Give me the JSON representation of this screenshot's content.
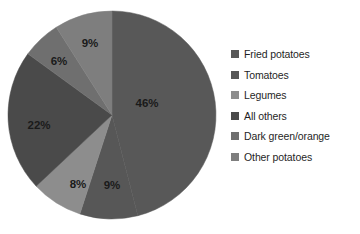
{
  "chart_data": {
    "type": "pie",
    "title": "",
    "subtitle": "",
    "xlabel": "",
    "ylabel": "",
    "grid": false,
    "legend_position": "right",
    "units": "percent",
    "start_angle_deg": 0,
    "direction": "clockwise",
    "categories": [
      "Fried potatoes",
      "Tomatoes",
      "Legumes",
      "All others",
      "Dark green/orange",
      "Other potatoes"
    ],
    "values": [
      46,
      9,
      8,
      22,
      6,
      9
    ],
    "data_labels": [
      "46%",
      "9%",
      "8%",
      "22%",
      "6%",
      "9%"
    ],
    "colors": [
      "#585858",
      "#575757",
      "#8d8d8d",
      "#4a4a4a",
      "#6f6f6f",
      "#7e7e7e"
    ],
    "slices": [
      {
        "label": "Fried potatoes",
        "value": 46,
        "data_label": "46%",
        "color": "#585858",
        "label_x": 147,
        "label_y": 104
      },
      {
        "label": "Tomatoes",
        "value": 9,
        "data_label": "9%",
        "color": "#575757",
        "label_x": 112,
        "label_y": 186
      },
      {
        "label": "Legumes",
        "value": 8,
        "data_label": "8%",
        "color": "#8d8d8d",
        "label_x": 78,
        "label_y": 185
      },
      {
        "label": "All others",
        "value": 22,
        "data_label": "22%",
        "color": "#4a4a4a",
        "label_x": 39,
        "label_y": 126
      },
      {
        "label": "Dark green/orange",
        "value": 6,
        "data_label": "6%",
        "color": "#6f6f6f",
        "label_x": 59,
        "label_y": 62
      },
      {
        "label": "Other potatoes",
        "value": 9,
        "data_label": "9%",
        "color": "#7e7e7e",
        "label_x": 90,
        "label_y": 44
      }
    ],
    "geometry": {
      "center_x": 112,
      "center_y": 115,
      "radius": 104
    }
  },
  "legend": {
    "items": [
      {
        "label": "Fried potatoes",
        "color": "#585858"
      },
      {
        "label": "Tomatoes",
        "color": "#575757"
      },
      {
        "label": "Legumes",
        "color": "#8d8d8d"
      },
      {
        "label": "All others",
        "color": "#4a4a4a"
      },
      {
        "label": "Dark green/orange",
        "color": "#6f6f6f"
      },
      {
        "label": "Other potatoes",
        "color": "#7e7e7e"
      }
    ]
  }
}
